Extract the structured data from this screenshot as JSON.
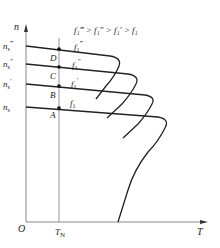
{
  "diagram": {
    "legend": "f₁‴ > f₁″ > f₁′ > f₁",
    "axes": {
      "y_label": "n",
      "x_label": "T",
      "origin_label": "O",
      "x_marker_label": "T_N"
    },
    "speed_levels": [
      {
        "label": "n_s‴",
        "base": "n",
        "sub": "s",
        "prime": "‴",
        "y": 46
      },
      {
        "label": "n_s″",
        "base": "n",
        "sub": "s",
        "prime": "″",
        "y": 64
      },
      {
        "label": "n_s′",
        "base": "n",
        "sub": "s",
        "prime": "′",
        "y": 84
      },
      {
        "label": "n_s",
        "base": "n",
        "sub": "s",
        "prime": "",
        "y": 107
      }
    ],
    "operating_points": [
      {
        "label": "D"
      },
      {
        "label": "C"
      },
      {
        "label": "B"
      },
      {
        "label": "A"
      }
    ],
    "curve_labels": [
      {
        "label": "f₁‴",
        "base": "f",
        "sub": "1",
        "prime": "‴"
      },
      {
        "label": "f₁″",
        "base": "f",
        "sub": "1",
        "prime": "″"
      },
      {
        "label": "f₁′",
        "base": "f",
        "sub": "1",
        "prime": "′"
      },
      {
        "label": "f₁",
        "base": "f",
        "sub": "1",
        "prime": ""
      }
    ],
    "colors": {
      "axis": "#888888",
      "curve": "#222222",
      "text": "#222222"
    }
  }
}
